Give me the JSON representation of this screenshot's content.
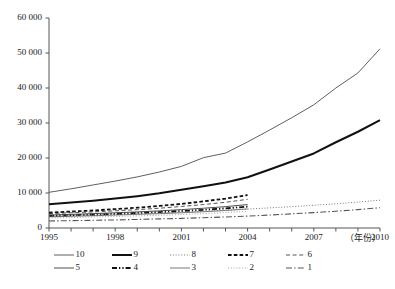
{
  "chart_data": {
    "type": "line",
    "title": "",
    "xlabel": "年份",
    "ylabel": "",
    "grid": false,
    "legend_position": "bottom",
    "xlim": [
      1995,
      2010
    ],
    "ylim": [
      0,
      60000
    ],
    "y_ticks": [
      0,
      10000,
      20000,
      30000,
      40000,
      50000,
      60000
    ],
    "y_tick_labels": [
      "0",
      "10 000",
      "20 000",
      "30 000",
      "40 000",
      "50 000",
      "60 000"
    ],
    "x_ticks": [
      1995,
      1996,
      1997,
      1998,
      1999,
      2000,
      2001,
      2002,
      2003,
      2004,
      2005,
      2006,
      2007,
      2008,
      2009,
      2010
    ],
    "x_tick_labels": [
      "1995",
      "",
      "",
      "1998",
      "",
      "",
      "2001",
      "",
      "",
      "2004",
      "",
      "",
      "2007",
      "",
      "",
      "2010"
    ],
    "x_axis_unit_label": "（年份）",
    "series": [
      {
        "name": "10",
        "legend_label": "10",
        "style": "solid-thin",
        "color": "#4d4d4d",
        "width": 0.9,
        "x": [
          1995,
          1996,
          1997,
          1998,
          1999,
          2000,
          2001,
          2002,
          2003,
          2004,
          2005,
          2006,
          2007,
          2008,
          2009,
          2010
        ],
        "values": [
          10200,
          11200,
          12300,
          13400,
          14600,
          16000,
          17600,
          20100,
          21400,
          24600,
          28000,
          31500,
          35200,
          40000,
          44300,
          51200
        ]
      },
      {
        "name": "9",
        "legend_label": "9",
        "style": "solid-thick",
        "color": "#111111",
        "width": 2.0,
        "x": [
          1995,
          1996,
          1997,
          1998,
          1999,
          2000,
          2001,
          2002,
          2003,
          2004,
          2005,
          2006,
          2007,
          2008,
          2009,
          2010
        ],
        "values": [
          6800,
          7300,
          7800,
          8400,
          9100,
          9900,
          10900,
          11900,
          13000,
          14500,
          16700,
          19000,
          21300,
          24500,
          27500,
          30800
        ]
      },
      {
        "name": "8",
        "legend_label": "8",
        "style": "dotted",
        "color": "#7a7a7a",
        "width": 1.0,
        "x": [
          1995,
          1996,
          1997,
          1998,
          1999,
          2000,
          2001,
          2002,
          2003,
          2004,
          2005,
          2006,
          2007,
          2008,
          2009,
          2010
        ],
        "values": [
          3400,
          3550,
          3700,
          3900,
          4050,
          4250,
          4500,
          4750,
          5050,
          5400,
          5750,
          6100,
          6500,
          6900,
          7400,
          7950
        ]
      },
      {
        "name": "7",
        "legend_label": "7",
        "style": "dashed-bold",
        "color": "#111111",
        "width": 1.8,
        "x": [
          1995,
          1996,
          1997,
          1998,
          1999,
          2000,
          2001,
          2002,
          2003,
          2004
        ],
        "values": [
          4400,
          4700,
          5000,
          5400,
          5800,
          6300,
          6900,
          7600,
          8400,
          9400
        ]
      },
      {
        "name": "6",
        "legend_label": "6",
        "style": "dashed",
        "color": "#555555",
        "width": 1.0,
        "x": [
          1995,
          1996,
          1997,
          1998,
          1999,
          2000,
          2001,
          2002,
          2003,
          2004
        ],
        "values": [
          4100,
          4350,
          4600,
          4900,
          5250,
          5650,
          6150,
          6700,
          7350,
          8200
        ]
      },
      {
        "name": "5",
        "legend_label": "5",
        "style": "solid-thin",
        "color": "#3a3a3a",
        "width": 0.9,
        "x": [
          1995,
          1996,
          1997,
          1998,
          1999,
          2000,
          2001,
          2002,
          2003,
          2004
        ],
        "values": [
          3700,
          3900,
          4100,
          4350,
          4600,
          4900,
          5250,
          5650,
          6100,
          6700
        ]
      },
      {
        "name": "4",
        "legend_label": "4",
        "style": "dash-dot-dot",
        "color": "#111111",
        "width": 1.8,
        "x": [
          1995,
          1996,
          1997,
          1998,
          1999,
          2000,
          2001,
          2002,
          2003,
          2004
        ],
        "values": [
          3500,
          3650,
          3850,
          4050,
          4300,
          4550,
          4850,
          5200,
          5600,
          6100
        ]
      },
      {
        "name": "3",
        "legend_label": "3",
        "style": "solid-thin",
        "color": "#6a6a6a",
        "width": 0.9,
        "x": [
          1995,
          1996,
          1997,
          1998,
          1999,
          2000,
          2001,
          2002,
          2003,
          2004
        ],
        "values": [
          3200,
          3350,
          3500,
          3700,
          3900,
          4100,
          4350,
          4650,
          5000,
          5450
        ]
      },
      {
        "name": "2",
        "legend_label": "2",
        "style": "dotted",
        "color": "#9a9a9a",
        "width": 0.9,
        "x": [
          1995,
          1996,
          1997,
          1998,
          1999,
          2000,
          2001,
          2002,
          2003,
          2004
        ],
        "values": [
          2900,
          3000,
          3150,
          3300,
          3450,
          3650,
          3850,
          4100,
          4400,
          4750
        ]
      },
      {
        "name": "1",
        "legend_label": "1",
        "style": "dash-dot",
        "color": "#555555",
        "width": 1.1,
        "x": [
          1995,
          1996,
          1997,
          1998,
          1999,
          2000,
          2001,
          2002,
          2003,
          2004,
          2005,
          2006,
          2007,
          2008,
          2009,
          2010
        ],
        "values": [
          2000,
          2100,
          2200,
          2300,
          2450,
          2600,
          2750,
          2950,
          3150,
          3400,
          3700,
          4050,
          4400,
          4800,
          5250,
          5800
        ]
      }
    ],
    "legend_rows": [
      [
        "10",
        "9",
        "8",
        "7",
        "6"
      ],
      [
        "5",
        "4",
        "3",
        "2",
        "1"
      ]
    ]
  }
}
